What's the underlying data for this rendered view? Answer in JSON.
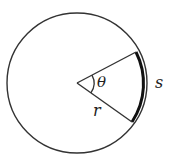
{
  "diagram": {
    "labels": {
      "angle": "θ",
      "arc": "s",
      "radius": "r"
    },
    "geometry": {
      "center": [
        77,
        83
      ],
      "radius": 70,
      "radius_endpoint_upper": [
        136,
        52
      ],
      "radius_endpoint_lower": [
        132,
        122
      ]
    },
    "colors": {
      "stroke": "#333333",
      "background": "#ffffff"
    }
  }
}
